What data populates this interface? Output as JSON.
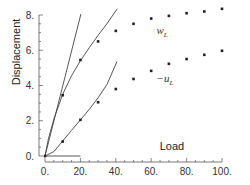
{
  "chart_data": {
    "type": "scatter",
    "title": "",
    "xlabel": "Load",
    "ylabel": "Displacement",
    "xlim": [
      0,
      100
    ],
    "ylim": [
      0,
      8
    ],
    "x_ticks": [
      0,
      20,
      40,
      60,
      80,
      100
    ],
    "x_tick_labels": [
      "0.",
      "20.",
      "40.",
      "60.",
      "80.",
      "100."
    ],
    "y_ticks": [
      0,
      2,
      4,
      6,
      8
    ],
    "y_tick_labels": [
      "0.",
      "2.",
      "4.",
      "6.",
      "8."
    ],
    "x_minor_step": 5,
    "y_minor_step": 0.5,
    "grid": false,
    "legend": "none",
    "series": [
      {
        "name": "w_L",
        "label_main": "w",
        "label_sub": "L",
        "label_prefix": "",
        "label_at": [
          63,
          6.9
        ],
        "marker": "dot",
        "x": [
          10,
          20,
          30,
          40,
          50,
          60,
          70,
          80,
          90,
          100
        ],
        "y": [
          3.45,
          5.45,
          6.5,
          7.1,
          7.5,
          7.8,
          7.95,
          8.1,
          8.2,
          8.35
        ]
      },
      {
        "name": "-u_L",
        "label_main": "u",
        "label_sub": "L",
        "label_prefix": "−",
        "label_at": [
          63,
          4.2
        ],
        "marker": "dot",
        "x": [
          10,
          20,
          30,
          40,
          50,
          60,
          70,
          80,
          90,
          100
        ],
        "y": [
          0.82,
          2.05,
          3.05,
          3.8,
          4.37,
          4.83,
          5.23,
          5.5,
          5.74,
          5.97
        ]
      }
    ],
    "reference_lines": [
      {
        "name": "initial-slope-line",
        "x": [
          0,
          20.3
        ],
        "y": [
          0,
          8.05
        ]
      },
      {
        "name": "zero-line",
        "x": [
          0,
          20
        ],
        "y": [
          0,
          0
        ]
      },
      {
        "name": "w-asymptotic-curve",
        "x": [
          0,
          2,
          5,
          10,
          15,
          20,
          25,
          30,
          35,
          40.8
        ],
        "y": [
          0,
          1.0,
          2.1,
          3.5,
          4.55,
          5.4,
          6.15,
          6.85,
          7.5,
          8.35
        ]
      },
      {
        "name": "u-asymptotic-curve",
        "x": [
          0,
          5,
          10,
          15,
          20,
          25,
          30,
          35,
          40.7
        ],
        "y": [
          0,
          0.25,
          0.85,
          1.45,
          2.05,
          2.65,
          3.3,
          4.05,
          5.36
        ]
      }
    ]
  }
}
